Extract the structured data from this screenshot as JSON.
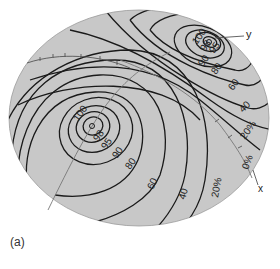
{
  "figure": {
    "caption": "(a)",
    "background_color": "#c8c8c8",
    "contour_color": "#1a1a1a",
    "axis_color": "#777777"
  },
  "axes": {
    "x_label": "x",
    "y_label": "y"
  },
  "peaks": [
    {
      "name": "lower-left-peak",
      "center_marker": "o",
      "labels": [
        "100",
        "98",
        "95",
        "90",
        "80",
        "60",
        "40",
        "20%"
      ]
    },
    {
      "name": "upper-right-peak",
      "center_marker": "o",
      "labels": [
        "100",
        "98",
        "95",
        "90",
        "80",
        "60",
        "40",
        "20%",
        "0%"
      ]
    }
  ],
  "labels": {
    "lower_100": "100",
    "lower_98": "98",
    "lower_95": "95",
    "lower_90": "90",
    "lower_80": "80",
    "lower_60": "60",
    "lower_40": "40",
    "lower_20": "20%",
    "upper_100": "100",
    "upper_98": "98",
    "upper_95": "95",
    "upper_90": "90",
    "upper_80": "80",
    "upper_60": "60",
    "upper_40": "40",
    "upper_20": "20%",
    "upper_0": "0%"
  }
}
